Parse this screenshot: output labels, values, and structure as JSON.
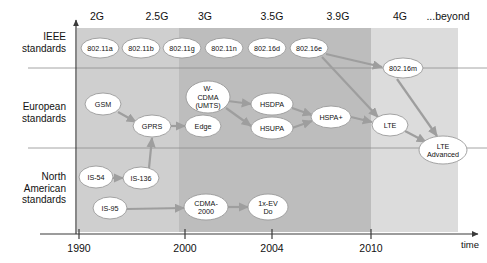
{
  "diagram": {
    "title_present": false,
    "time_axis_label": "time",
    "generations": [
      {
        "label": "2G",
        "x": 97
      },
      {
        "label": "2.5G",
        "x": 157
      },
      {
        "label": "3G",
        "x": 205
      },
      {
        "label": "3.5G",
        "x": 272
      },
      {
        "label": "3.9G",
        "x": 338
      },
      {
        "label": "4G",
        "x": 400
      },
      {
        "label": "...beyond",
        "x": 448
      }
    ],
    "years": [
      {
        "label": "1990",
        "x": 79
      },
      {
        "label": "2000",
        "x": 185
      },
      {
        "label": "2004",
        "x": 272
      },
      {
        "label": "2010",
        "x": 371
      }
    ],
    "rows": [
      {
        "id": "ieee",
        "lines": [
          "IEEE",
          "standards"
        ],
        "label_y": 40
      },
      {
        "id": "european",
        "lines": [
          "European",
          "standards"
        ],
        "label_y": 110
      },
      {
        "id": "namerica",
        "lines": [
          "North",
          "American",
          "standards"
        ],
        "label_y": 180
      }
    ],
    "bands": [
      {
        "name": "band-2g-2.5g",
        "x": 77,
        "width": 102,
        "color": "#cfcfcf"
      },
      {
        "name": "band-3g-3.9g",
        "x": 179,
        "width": 192,
        "color": "#bdbdbd"
      },
      {
        "name": "band-4g-beyond",
        "x": 371,
        "width": 87,
        "color": "#dcdcdc"
      }
    ],
    "separators_y": [
      68,
      148
    ],
    "nodes": [
      {
        "id": "n80211a",
        "label": "802.11a",
        "cx": 100,
        "cy": 48,
        "rx": 19,
        "ry": 10,
        "row": "ieee"
      },
      {
        "id": "n80211b",
        "label": "802.11b",
        "cx": 141,
        "cy": 48,
        "rx": 19,
        "ry": 10,
        "row": "ieee"
      },
      {
        "id": "n80211g",
        "label": "802.11g",
        "cx": 182,
        "cy": 48,
        "rx": 19,
        "ry": 10,
        "row": "ieee"
      },
      {
        "id": "n80211n",
        "label": "802.11n",
        "cx": 224,
        "cy": 48,
        "rx": 19,
        "ry": 10,
        "row": "ieee"
      },
      {
        "id": "n80216d",
        "label": "802.16d",
        "cx": 267,
        "cy": 48,
        "rx": 19,
        "ry": 10,
        "row": "ieee"
      },
      {
        "id": "n80216e",
        "label": "802.16e",
        "cx": 309,
        "cy": 48,
        "rx": 19,
        "ry": 10,
        "row": "ieee"
      },
      {
        "id": "n80216m",
        "label": "802.16m",
        "cx": 403,
        "cy": 68,
        "rx": 20,
        "ry": 10,
        "row": "ieee"
      },
      {
        "id": "ngsm",
        "label": "GSM",
        "cx": 103,
        "cy": 104,
        "rx": 18,
        "ry": 11,
        "row": "european"
      },
      {
        "id": "ngprs",
        "label": "GPRS",
        "cx": 152,
        "cy": 126,
        "rx": 19,
        "ry": 11,
        "row": "european"
      },
      {
        "id": "nedge",
        "label": "Edge",
        "cx": 203,
        "cy": 126,
        "rx": 18,
        "ry": 11,
        "row": "european"
      },
      {
        "id": "nwcdma",
        "label": "W-\nCDMA\n(UMTS)",
        "cx": 208,
        "cy": 97,
        "rx": 22,
        "ry": 16,
        "row": "european",
        "multiline": [
          "W-",
          "CDMA",
          "(UMTS)"
        ]
      },
      {
        "id": "nhsdpa",
        "label": "HSDPA",
        "cx": 272,
        "cy": 104,
        "rx": 21,
        "ry": 11,
        "row": "european"
      },
      {
        "id": "nhsupa",
        "label": "HSUPA",
        "cx": 272,
        "cy": 128,
        "rx": 21,
        "ry": 11,
        "row": "european"
      },
      {
        "id": "nhspaplus",
        "label": "HSPA+",
        "cx": 331,
        "cy": 117,
        "rx": 20,
        "ry": 11,
        "row": "european"
      },
      {
        "id": "nlte",
        "label": "LTE",
        "cx": 390,
        "cy": 125,
        "rx": 18,
        "ry": 11,
        "row": "european"
      },
      {
        "id": "nlteadv",
        "label": "LTE\nAdvanced",
        "cx": 443,
        "cy": 150,
        "rx": 24,
        "ry": 14,
        "row": "european",
        "multiline": [
          "LTE",
          "Advanced"
        ]
      },
      {
        "id": "nis54",
        "label": "IS-54",
        "cx": 96,
        "cy": 177,
        "rx": 17,
        "ry": 11,
        "row": "namerica"
      },
      {
        "id": "nis136",
        "label": "IS-136",
        "cx": 141,
        "cy": 178,
        "rx": 18,
        "ry": 11,
        "row": "namerica"
      },
      {
        "id": "nis95",
        "label": "IS-95",
        "cx": 110,
        "cy": 208,
        "rx": 17,
        "ry": 11,
        "row": "namerica"
      },
      {
        "id": "ncdma2000",
        "label": "CDMA-\n2000",
        "cx": 206,
        "cy": 207,
        "rx": 22,
        "ry": 13,
        "row": "namerica",
        "multiline": [
          "CDMA-",
          "2000"
        ]
      },
      {
        "id": "n1xevdo",
        "label": "1x-EV\nDo",
        "cx": 268,
        "cy": 207,
        "rx": 20,
        "ry": 13,
        "row": "namerica",
        "multiline": [
          "1x-EV",
          "Do"
        ]
      }
    ],
    "edges": [
      {
        "from": "ngsm",
        "to": "ngprs",
        "x1": 118,
        "y1": 112,
        "x2": 136,
        "y2": 122
      },
      {
        "from": "ngprs",
        "to": "nedge",
        "x1": 171,
        "y1": 126,
        "x2": 185,
        "y2": 126
      },
      {
        "from": "nis136",
        "to": "ngprs",
        "x1": 149,
        "y1": 168,
        "x2": 152,
        "y2": 138
      },
      {
        "from": "nis54",
        "to": "nis136",
        "x1": 113,
        "y1": 178,
        "x2": 123,
        "y2": 178
      },
      {
        "from": "nis95",
        "to": "ncdma2000",
        "x1": 127,
        "y1": 209,
        "x2": 184,
        "y2": 208
      },
      {
        "from": "ncdma2000",
        "to": "n1xevdo",
        "x1": 228,
        "y1": 207,
        "x2": 248,
        "y2": 207
      },
      {
        "from": "nwcdma",
        "to": "nhsdpa",
        "x1": 228,
        "y1": 101,
        "x2": 251,
        "y2": 104
      },
      {
        "from": "nwcdma",
        "to": "nhsupa",
        "x1": 226,
        "y1": 108,
        "x2": 251,
        "y2": 126
      },
      {
        "from": "nhsdpa",
        "to": "nhspaplus",
        "x1": 292,
        "y1": 108,
        "x2": 312,
        "y2": 115
      },
      {
        "from": "nhsupa",
        "to": "nhspaplus",
        "x1": 292,
        "y1": 128,
        "x2": 312,
        "y2": 121
      },
      {
        "from": "nhspaplus",
        "to": "nlte",
        "x1": 351,
        "y1": 117,
        "x2": 372,
        "y2": 122
      },
      {
        "from": "n80216e",
        "to": "n80216m",
        "x1": 326,
        "y1": 54,
        "x2": 382,
        "y2": 67
      },
      {
        "from": "n80216e",
        "to": "nlte",
        "x1": 322,
        "y1": 57,
        "x2": 378,
        "y2": 117
      },
      {
        "from": "nlte",
        "to": "nlteadv",
        "x1": 405,
        "y1": 131,
        "x2": 426,
        "y2": 142
      },
      {
        "from": "n80216m",
        "to": "nlteadv",
        "x1": 397,
        "y1": 79,
        "x2": 437,
        "y2": 136
      }
    ],
    "accent_colors": {
      "node_fill": "#ffffff",
      "node_stroke": "#9a9a9a",
      "arrow": "#9e9e9e",
      "band_light": "#cfcfcf",
      "band_dark": "#bdbdbd",
      "band_lightest": "#dcdcdc",
      "text": "#111111"
    }
  }
}
